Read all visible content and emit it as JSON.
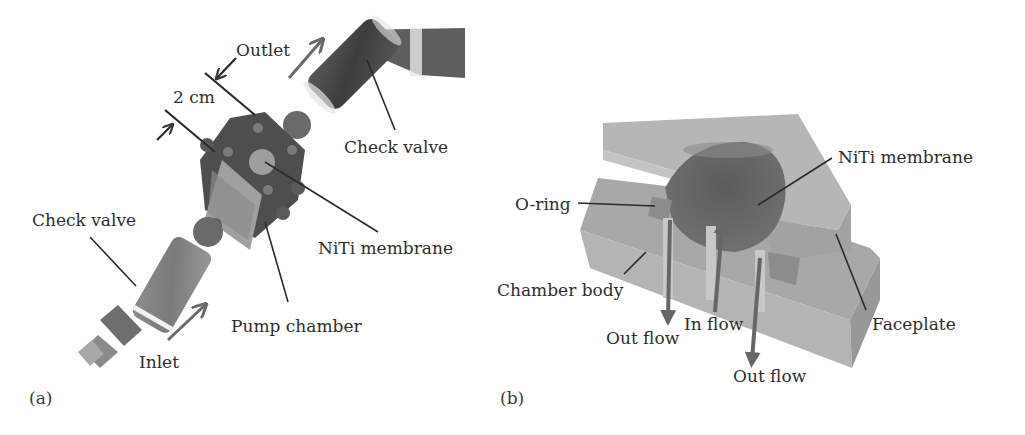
{
  "figure": {
    "panels": [
      {
        "id": "a",
        "tag": "(a)",
        "description": "Photograph of assembled pump",
        "labels": {
          "outlet": "Outlet",
          "dimension": "2 cm",
          "check_valve_top": "Check valve",
          "check_valve_bottom": "Check valve",
          "niti_membrane": "NiTi membrane",
          "pump_chamber": "Pump chamber",
          "inlet": "Inlet"
        }
      },
      {
        "id": "b",
        "tag": "(b)",
        "description": "Cutaway schematic of pump chamber",
        "labels": {
          "niti_membrane": "NiTi membrane",
          "o_ring": "O-ring",
          "chamber_body": "Chamber body",
          "faceplate": "Faceplate",
          "in_flow": "In flow",
          "out_flow_left": "Out flow",
          "out_flow_right": "Out flow"
        }
      }
    ],
    "colors": {
      "background": "#ffffff",
      "text": "#2e2e2e",
      "leader_line": "#2a2a2a",
      "arrow": "#6a6a6a",
      "plate_light": "#a9a9a9",
      "plate_top": "#b8b8b8",
      "plate_side": "#9a9a9a",
      "membrane": "#6e6e6e",
      "device_dark": "#4a4a4a"
    }
  }
}
